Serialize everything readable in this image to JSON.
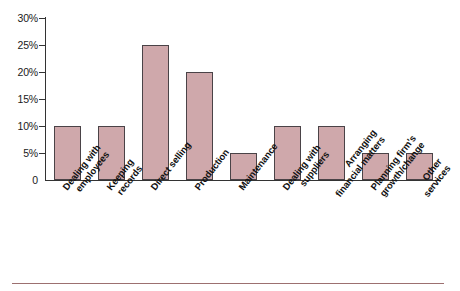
{
  "chart_data": {
    "type": "bar",
    "title": "",
    "xlabel": "",
    "ylabel": "",
    "categories": [
      "Dealing with employees",
      "Keeping records",
      "Direct selling",
      "Production",
      "Maintenance",
      "Dealing with suppliers",
      "Arranging financial matters",
      "Planning firm's growth/change",
      "Other services"
    ],
    "category_lines": [
      [
        "Dealing with",
        "employees"
      ],
      [
        "Keeping",
        "records"
      ],
      [
        "Direct selling",
        ""
      ],
      [
        "Production",
        ""
      ],
      [
        "Maintenance",
        ""
      ],
      [
        "Dealing with",
        "suppliers"
      ],
      [
        "Arranging",
        "financial matters"
      ],
      [
        "Planning firm's",
        "growth/change"
      ],
      [
        "Other",
        "services"
      ]
    ],
    "values": [
      10,
      10,
      25,
      20,
      5,
      10,
      10,
      5,
      5
    ],
    "ylim": [
      0,
      30
    ],
    "ytick_values": [
      0,
      5,
      10,
      15,
      20,
      25,
      30
    ],
    "ytick_labels": [
      "0",
      "5%",
      "10%",
      "15%",
      "20%",
      "25%",
      "30%"
    ],
    "grid": false,
    "legend": null,
    "legend_position": "none",
    "bar_color": "#cfa8ab",
    "bar_edge_color": "#4a4347",
    "axis_color": "#333333",
    "background_color": "#ffffff",
    "rule_color": "#9c7070"
  }
}
